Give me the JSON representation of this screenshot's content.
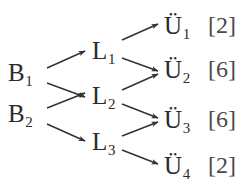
{
  "diagram": {
    "type": "layered-flow-graph",
    "background_color": "#ffffff",
    "text_color": "#2b2b2b",
    "edge_color": "#333333",
    "layers": {
      "source": {
        "name": "B",
        "nodes": [
          {
            "id": "B1",
            "base": "B",
            "sub": "1",
            "y": 72
          },
          {
            "id": "B2",
            "base": "B",
            "sub": "2",
            "y": 113
          }
        ]
      },
      "middle": {
        "name": "L",
        "nodes": [
          {
            "id": "L1",
            "base": "L",
            "sub": "1",
            "y": 50
          },
          {
            "id": "L2",
            "base": "L",
            "sub": "2",
            "y": 95
          },
          {
            "id": "L3",
            "base": "L",
            "sub": "3",
            "y": 141
          }
        ]
      },
      "target": {
        "name": "U",
        "nodes": [
          {
            "id": "U1",
            "base": "Ü",
            "sub": "1",
            "y": 25,
            "weight": "[2]"
          },
          {
            "id": "U2",
            "base": "Ü",
            "sub": "2",
            "y": 69,
            "weight": "[6]"
          },
          {
            "id": "U3",
            "base": "Ü",
            "sub": "3",
            "y": 119,
            "weight": "[6]"
          },
          {
            "id": "U4",
            "base": "Ü",
            "sub": "4",
            "y": 165,
            "weight": "[2]"
          }
        ]
      }
    },
    "edges": [
      {
        "from": "B1",
        "to": "L1"
      },
      {
        "from": "B1",
        "to": "L2"
      },
      {
        "from": "B2",
        "to": "L2"
      },
      {
        "from": "B2",
        "to": "L3"
      },
      {
        "from": "L1",
        "to": "U1"
      },
      {
        "from": "L1",
        "to": "U2"
      },
      {
        "from": "L2",
        "to": "U2"
      },
      {
        "from": "L2",
        "to": "U3"
      },
      {
        "from": "L3",
        "to": "U3"
      },
      {
        "from": "L3",
        "to": "U4"
      }
    ]
  }
}
